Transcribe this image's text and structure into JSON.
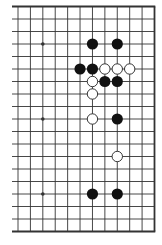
{
  "diagram": {
    "type": "go-board-fragment",
    "edges": {
      "top": true,
      "right": true,
      "bottom": true,
      "left": false
    },
    "columns": 12,
    "rows": 19,
    "colors": {
      "line": "#333333",
      "edge": "#333333",
      "black_stone": "#111111",
      "white_stone": "#ffffff",
      "background": "#ffffff"
    },
    "star_points": [
      {
        "col": 2,
        "row": 3
      },
      {
        "col": 2,
        "row": 9
      },
      {
        "col": 2,
        "row": 15
      }
    ],
    "stones": [
      {
        "color": "black",
        "col": 6,
        "row": 3
      },
      {
        "color": "black",
        "col": 8,
        "row": 3
      },
      {
        "color": "black",
        "col": 5,
        "row": 5
      },
      {
        "color": "black",
        "col": 6,
        "row": 5
      },
      {
        "color": "white",
        "col": 7,
        "row": 5
      },
      {
        "color": "white",
        "col": 8,
        "row": 5
      },
      {
        "color": "white",
        "col": 9,
        "row": 5
      },
      {
        "color": "white",
        "col": 6,
        "row": 6
      },
      {
        "color": "black",
        "col": 7,
        "row": 6
      },
      {
        "color": "black",
        "col": 8,
        "row": 6
      },
      {
        "color": "white",
        "col": 6,
        "row": 7
      },
      {
        "color": "white",
        "col": 6,
        "row": 9
      },
      {
        "color": "black",
        "col": 8,
        "row": 9
      },
      {
        "color": "white",
        "col": 8,
        "row": 12
      },
      {
        "color": "black",
        "col": 6,
        "row": 15
      },
      {
        "color": "black",
        "col": 8,
        "row": 15
      }
    ]
  }
}
